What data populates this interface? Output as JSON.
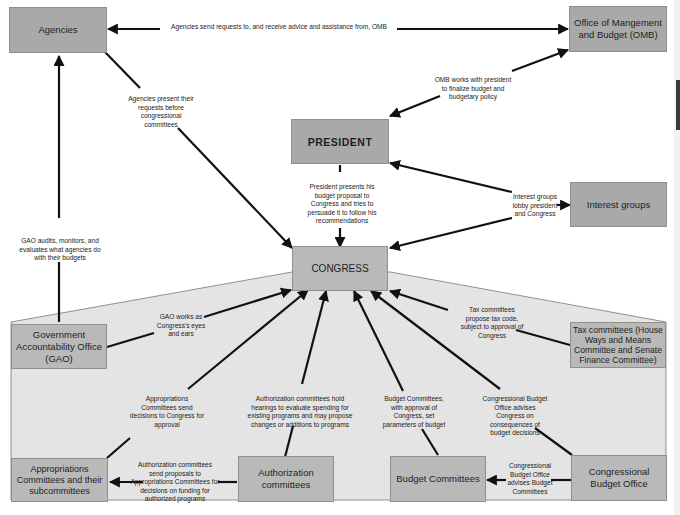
{
  "diagram": {
    "colors": {
      "box_fill": "#a9a9a9",
      "congress_region_fill": "#e4e4e4",
      "arrow": "#111111",
      "background": "#ffffff"
    },
    "nodes": {
      "agencies": "Agencies",
      "omb": "Office of Mangement and Budget (OMB)",
      "president": "PRESIDENT",
      "interest_groups": "Interest groups",
      "congress": "CONGRESS",
      "gao": "Government Accountability Office (GAO)",
      "tax_committees": "Tax committees (House Ways and Means Committee and Senate Finance Committee)",
      "appropriations": "Appropriations Committees and their subcommittees",
      "authorization": "Authorization committees",
      "budget_committees": "Budget Committees",
      "cbo": "Congressional Budget Office"
    },
    "edges": {
      "agencies_omb": "Agencies send requests to, and receive advice and assistance from, OMB",
      "agencies_congress": "Agencies present their requests before congressional committees",
      "omb_president": "OMB works with president to finalize budget and budgetary policy",
      "president_congress": "President presents his budget proposal to Congress and tries to persuade it to follow his recommendations",
      "interest_groups": "Interest groups lobby president and Congress",
      "gao_agencies": "GAO audits, monitors, and evaluates what agencies do with their budgets",
      "gao_congress": "GAO works as Congress's eyes and ears",
      "tax_congress": "Tax committees propose tax code, subject to approval of Congress",
      "appropriations_congress": "Appropriations Committees send decisions to Congress for approval",
      "authorization_congress": "Authorization committees hold hearings to evaluate spending for existing programs and may propose changes or additions to programs",
      "budget_congress": "Budget Committees, with approval of Congress, set parameters of budget",
      "cbo_congress": "Congressional Budget Office advises Congress on consequences of budget decisions",
      "authorization_appropriations": "Authorization committees send proposals to Appropriations Committees for decisions on funding for authorized programs",
      "cbo_budget": "Congressional Budget Office advises Budget Committees"
    }
  }
}
